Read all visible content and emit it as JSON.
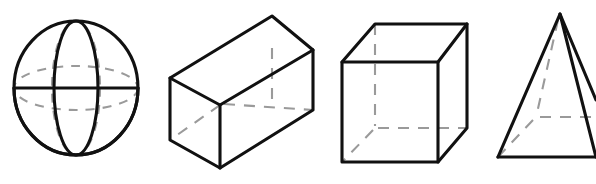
{
  "figure": {
    "background_color": "#ffffff",
    "outline_color": "#111111",
    "hidden_edge_color": "#9a9a9a",
    "shape_count": 4,
    "shapes": [
      {
        "index": 1,
        "name": "sphere",
        "label": "Sphere",
        "description": "Circle with solid vertical and horizontal great-circle ellipses and dashed hidden great circles",
        "center_x": 76,
        "center_y": 88,
        "radius_x": 62,
        "radius_y": 67,
        "visible_edges": 3,
        "hidden_edges": 2
      },
      {
        "index": 2,
        "name": "rectangular-prism",
        "label": "Rectangular Prism",
        "description": "Open-ended cuboid drawn in oblique projection with dashed hidden back edges",
        "visible_vertices": 7,
        "hidden_vertices": 1,
        "hidden_edges": 3
      },
      {
        "index": 3,
        "name": "cube",
        "label": "Cube",
        "description": "Cube in oblique projection with one hidden rear vertex and three dashed hidden edges",
        "visible_vertices": 7,
        "hidden_vertices": 1,
        "hidden_edges": 3
      },
      {
        "index": 4,
        "name": "square-pyramid",
        "label": "Square Pyramid",
        "description": "Square-based pyramid with apex, solid lateral edges and dashed hidden base edges",
        "apex_x": 560,
        "apex_y": 14,
        "visible_vertices": 4,
        "hidden_vertices": 1,
        "hidden_edges": 3,
        "clipped_at_right_edge": true
      }
    ]
  }
}
